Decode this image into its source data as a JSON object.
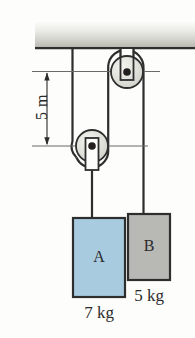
{
  "figure": {
    "ceiling": {
      "name": "ceiling-support",
      "color_top": "#f2f2ee",
      "color_bottom": "#b9b9b2",
      "edge_color": "#2e2e2e"
    },
    "dimension": {
      "label": "5 m",
      "value": 5,
      "unit": "m",
      "orientation": "vertical",
      "from": "upper pulley axle",
      "to": "lower pulley axle",
      "line_color": "#5a5a58",
      "arrow_color": "#2b2b2b"
    },
    "pulleys": [
      {
        "id": "upper-pulley",
        "label": "",
        "type": "fixed",
        "cx": 127,
        "cy": 72,
        "r": 16,
        "face_color": "#e2e2dc",
        "edge_color": "#2e2e2e",
        "axle_color": "#231f20",
        "bracket": "up"
      },
      {
        "id": "lower-pulley",
        "label": "",
        "type": "movable",
        "cx": 92,
        "cy": 146,
        "r": 16,
        "face_color": "#e2e2dc",
        "edge_color": "#2e2e2e",
        "axle_color": "#231f20",
        "bracket": "down"
      }
    ],
    "rope": {
      "color": "#2e2e2e",
      "width": 2,
      "segments": [
        "ceiling to lower pulley left",
        "lower pulley right to upper pulley left",
        "upper pulley right down to block B"
      ]
    },
    "blocks": [
      {
        "id": "block-a",
        "letter": "A",
        "mass_label": "7 kg",
        "mass_value": 7,
        "unit": "kg",
        "fill": "#a8cbe0",
        "edge": "#2e2e2e",
        "x": 73,
        "y": 218,
        "w": 52,
        "h": 79,
        "hangs_from": "lower-pulley"
      },
      {
        "id": "block-b",
        "letter": "B",
        "mass_label": "5 kg",
        "mass_value": 5,
        "unit": "kg",
        "fill": "#b8b8b4",
        "edge": "#2e2e2e",
        "x": 128,
        "y": 214,
        "w": 42,
        "h": 66,
        "hangs_from": "upper-pulley"
      }
    ]
  }
}
